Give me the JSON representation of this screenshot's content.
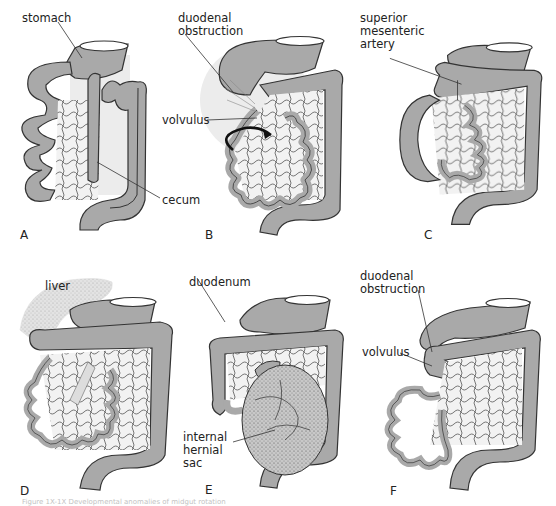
{
  "figure": {
    "caption": "Figure 1X-1X  Developmental anomalies of midgut rotation",
    "colors": {
      "gut_fill": "#a9a9a9",
      "gut_stroke": "#333333",
      "mesentery_fill": "#e4e4e4",
      "background": "#ffffff"
    },
    "panels": [
      {
        "letter": "A",
        "labels": [
          "stomach",
          "cecum"
        ]
      },
      {
        "letter": "B",
        "labels": [
          "duodenal\nobstruction",
          "volvulus"
        ]
      },
      {
        "letter": "C",
        "labels": [
          "superior\nmesenteric\nartery"
        ]
      },
      {
        "letter": "D",
        "labels": [
          "liver"
        ]
      },
      {
        "letter": "E",
        "labels": [
          "duodenum",
          "internal\nhernial\nsac"
        ]
      },
      {
        "letter": "F",
        "labels": [
          "duodenal\nobstruction",
          "volvulus"
        ]
      }
    ]
  },
  "labels": {
    "a_stomach": "stomach",
    "a_cecum": "cecum",
    "b_duodenal_1": "duodenal",
    "b_duodenal_2": "obstruction",
    "b_volvulus": "volvulus",
    "c_sma_1": "superior",
    "c_sma_2": "mesenteric",
    "c_sma_3": "artery",
    "d_liver": "liver",
    "e_duodenum": "duodenum",
    "e_hernia_1": "internal",
    "e_hernia_2": "hernial",
    "e_hernia_3": "sac",
    "f_duodenal_1": "duodenal",
    "f_duodenal_2": "obstruction",
    "f_volvulus": "volvulus"
  },
  "letters": {
    "a": "A",
    "b": "B",
    "c": "C",
    "d": "D",
    "e": "E",
    "f": "F"
  }
}
